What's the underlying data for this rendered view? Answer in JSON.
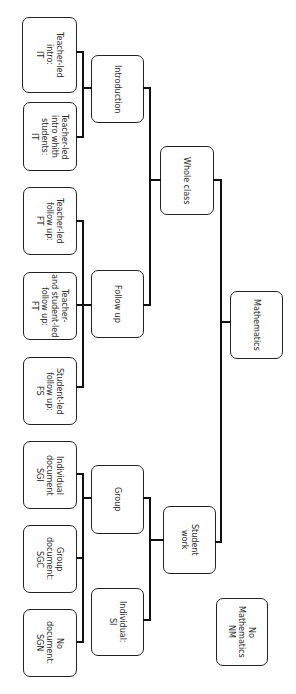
{
  "diagram": {
    "type": "tree",
    "orientation": "rotated-90-clockwise",
    "root": {
      "id": "mathematics",
      "label": "Mathematics",
      "children": [
        {
          "id": "whole-class",
          "label": "Whole class",
          "children": [
            {
              "id": "introduction",
              "label": "Introduction",
              "children": [
                {
                  "id": "teacher-led-intro",
                  "label": "Teacher-led\nintro:\nIT"
                },
                {
                  "id": "teacher-led-intro-with-students",
                  "label": "Teacher-led\nintro whith\nstudents:\nIT"
                }
              ]
            },
            {
              "id": "follow-up",
              "label": "Follow up",
              "children": [
                {
                  "id": "teacher-led-follow-up",
                  "label": "Teacher-led\nfollow up:\nFT"
                },
                {
                  "id": "teacher-and-student-led-follow-up",
                  "label": "Teacher-\nand student-led\nfollow up:\nFT"
                },
                {
                  "id": "student-led-follow-up",
                  "label": "Student-led\nfollow up:\nFS"
                }
              ]
            }
          ]
        },
        {
          "id": "student-work",
          "label": "Student\nwork",
          "children": [
            {
              "id": "group",
              "label": "Group",
              "children": [
                {
                  "id": "individual-document",
                  "label": "Individual\ndocument\nSGI"
                },
                {
                  "id": "group-document",
                  "label": "Group\ndocument:\nSGC"
                },
                {
                  "id": "no-document",
                  "label": "No\ndocument:\nSGN"
                }
              ]
            },
            {
              "id": "individual",
              "label": "Individual:\nSI",
              "children": []
            }
          ]
        }
      ]
    },
    "standalone": [
      {
        "id": "no-mathematics",
        "label": "No\nMathematics\nNM"
      }
    ]
  },
  "nodes": {
    "teacher_led_intro": "Teacher-led\nintro:\nIT",
    "teacher_led_intro_with_students": "Teacher-led\nintro whith\nstudents:\nIT",
    "teacher_led_follow_up": "Teacher-led\nfollow up:\nFT",
    "teacher_and_student_led_follow_up": "Teacher-\nand student-led\nfollow up:\nFT",
    "student_led_follow_up": "Student-led\nfollow up:\nFS",
    "individual_document": "Individual\ndocument\nSGI",
    "group_document": "Group\ndocument:\nSGC",
    "no_document": "No\ndocument:\nSGN",
    "introduction": "Introduction",
    "follow_up": "Follow up",
    "group": "Group",
    "individual": "Individual:\nSI",
    "whole_class": "Whole class",
    "student_work": "Student\nwork",
    "mathematics": "Mathematics",
    "no_mathematics": "No\nMathematics\nNM"
  },
  "colors": {
    "line": "#111111",
    "border": "#222222",
    "text": "#2a2a2a",
    "background": "#ffffff"
  }
}
